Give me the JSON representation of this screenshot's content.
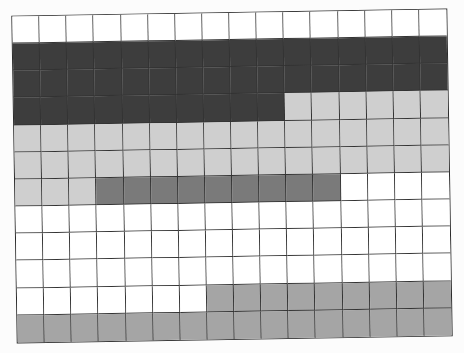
{
  "grid": {
    "columns": 16,
    "rows": 12,
    "palette": {
      "W": "#ffffff",
      "D": "#3d3d3d",
      "L": "#cfcfcf",
      "M": "#7a7a7a",
      "G": "#a5a5a5"
    },
    "cells": [
      "WWWWWWWWWWWWWWWW",
      "DDDDDDDDDDDDDDDD",
      "DDDDDDDDDDDDDDDD",
      "DDDDDDDDDDLLLLLL",
      "LLLLLLLLLLLLLLLL",
      "LLLLLLLLLLLLLLLL",
      "LLLMMMMMMMMMWWWW",
      "WWWWWWWWWWWWWWWW",
      "WWWWWWWWWWWWWWWW",
      "WWWWWWWWWWWWWWWW",
      "WWWWWWWGGGGGGGGG",
      "GGGGGGGGGGGGGGGG"
    ]
  }
}
